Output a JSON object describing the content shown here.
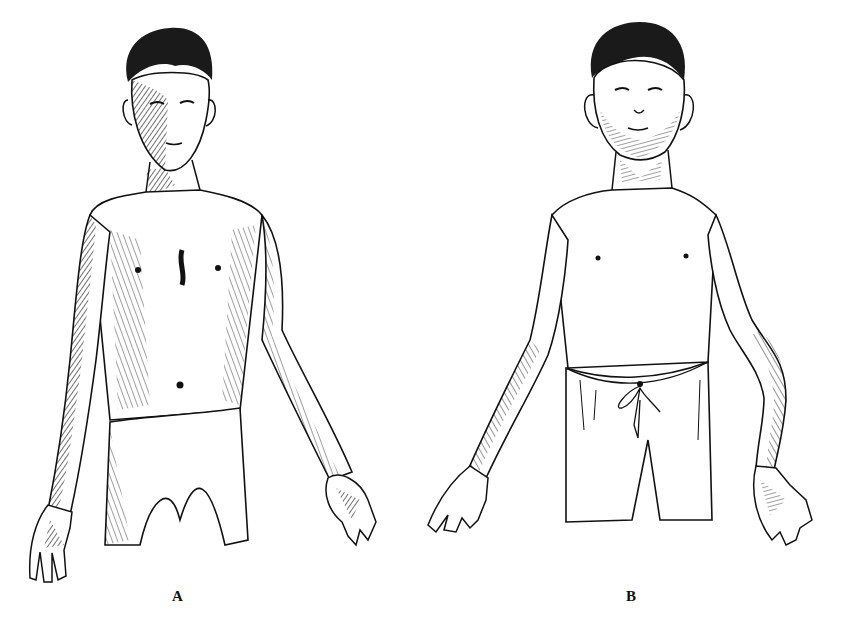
{
  "figure": {
    "type": "anatomical-illustration",
    "style": "pen-and-ink line drawing",
    "panels": [
      {
        "label": "A",
        "subject": "thin adolescent boy, standing, arms at sides, palms forward, wearing loincloth"
      },
      {
        "label": "B",
        "subject": "boy standing, arms outstretched downward, palms forward, wearing drawstring shorts"
      }
    ]
  },
  "labels": {
    "a": "A",
    "b": "B"
  },
  "colors": {
    "ink": "#111111",
    "paper": "#ffffff"
  }
}
